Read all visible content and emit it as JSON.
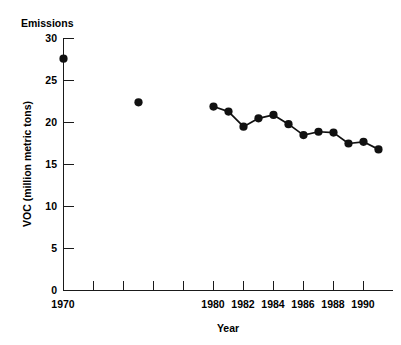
{
  "chart_data": {
    "type": "line",
    "title": "Emissions",
    "xlabel": "Year",
    "ylabel": "VOC (million metric tons)",
    "xlim": [
      1969,
      1992
    ],
    "ylim": [
      0,
      30
    ],
    "grid": false,
    "legend": "none",
    "xticks": [
      1970,
      1972,
      1974,
      1976,
      1978,
      1980,
      1982,
      1984,
      1986,
      1988,
      1990
    ],
    "xtick_labels": [
      "1970",
      "",
      "",
      "",
      "",
      "1980",
      "1982",
      "1984",
      "1986",
      "1988",
      "1990"
    ],
    "yticks": [
      0,
      5,
      10,
      15,
      20,
      25,
      30
    ],
    "ytick_labels": [
      "0",
      "5",
      "10",
      "15",
      "20",
      "25",
      "30"
    ],
    "series": [
      {
        "name": "VOC emissions (isolated points)",
        "mode": "markers",
        "x": [
          1970,
          1975
        ],
        "values": [
          27.6,
          22.4
        ]
      },
      {
        "name": "VOC emissions (annual series)",
        "mode": "lines+markers",
        "x": [
          1980,
          1981,
          1982,
          1983,
          1984,
          1985,
          1986,
          1987,
          1988,
          1989,
          1990,
          1991
        ],
        "values": [
          21.9,
          21.3,
          19.5,
          20.5,
          20.9,
          19.8,
          18.5,
          18.9,
          18.8,
          17.5,
          17.7,
          16.8
        ]
      }
    ]
  },
  "style": {
    "ink_color": "#111111",
    "axis_color": "#1a1a1a",
    "background": "#ffffff"
  }
}
